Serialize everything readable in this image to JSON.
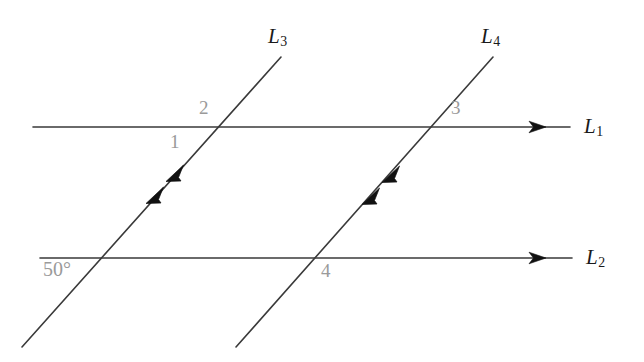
{
  "figure": {
    "kind": "geometry-diagram",
    "background_color": "#ffffff",
    "stroke_color": "#3a3a3a",
    "angle_label_color": "#9a9a9a",
    "line_label_color": "#1a1a1a",
    "canvas": {
      "width": 644,
      "height": 362
    }
  },
  "lines": [
    {
      "id": "L1",
      "label": "L",
      "subscript": "1",
      "role": "horizontal-parallel-line-top",
      "arrowheads": 1,
      "arrow_direction": "right",
      "start": {
        "x": 33,
        "y": 127
      },
      "end": {
        "x": 570,
        "y": 127
      }
    },
    {
      "id": "L2",
      "label": "L",
      "subscript": "2",
      "role": "horizontal-parallel-line-bottom",
      "arrowheads": 1,
      "arrow_direction": "right",
      "start": {
        "x": 40,
        "y": 258
      },
      "end": {
        "x": 572,
        "y": 258
      }
    },
    {
      "id": "L3",
      "label": "L",
      "subscript": "3",
      "role": "transversal-left",
      "arrowheads": 2,
      "arrow_direction": "up-right",
      "start": {
        "x": 22,
        "y": 347
      },
      "end": {
        "x": 281,
        "y": 57
      }
    },
    {
      "id": "L4",
      "label": "L",
      "subscript": "4",
      "role": "transversal-right",
      "arrowheads": 2,
      "arrow_direction": "up-right",
      "start": {
        "x": 236,
        "y": 347
      },
      "end": {
        "x": 493,
        "y": 57
      }
    }
  ],
  "line_labels": [
    {
      "name": "L1",
      "text": "L",
      "sub": "1",
      "x": 584,
      "y": 116
    },
    {
      "name": "L2",
      "text": "L",
      "sub": "2",
      "x": 586,
      "y": 247
    },
    {
      "name": "L3",
      "text": "L",
      "sub": "3",
      "x": 268,
      "y": 26
    },
    {
      "name": "L4",
      "text": "L",
      "sub": "4",
      "x": 481,
      "y": 26
    }
  ],
  "angle_labels": [
    {
      "name": "angle-1",
      "text": "1",
      "x": 170,
      "y": 132,
      "at_intersection": "L3-L1",
      "position": "below-left"
    },
    {
      "name": "angle-2",
      "text": "2",
      "x": 199,
      "y": 98,
      "at_intersection": "L3-L1",
      "position": "above-left"
    },
    {
      "name": "angle-3",
      "text": "3",
      "x": 451,
      "y": 98,
      "at_intersection": "L4-L1",
      "position": "above-right"
    },
    {
      "name": "angle-4",
      "text": "4",
      "x": 321,
      "y": 261,
      "at_intersection": "L4-L2",
      "position": "below-right"
    },
    {
      "name": "angle-50-degrees",
      "text": "50°",
      "x": 43,
      "y": 259,
      "at_intersection": "L3-L2",
      "position": "below-left"
    }
  ],
  "intersections": [
    {
      "name": "L3-L1",
      "x": 210,
      "y": 127
    },
    {
      "name": "L4-L1",
      "x": 426,
      "y": 127
    },
    {
      "name": "L3-L2",
      "x": 95,
      "y": 258
    },
    {
      "name": "L4-L2",
      "x": 312,
      "y": 258
    }
  ]
}
